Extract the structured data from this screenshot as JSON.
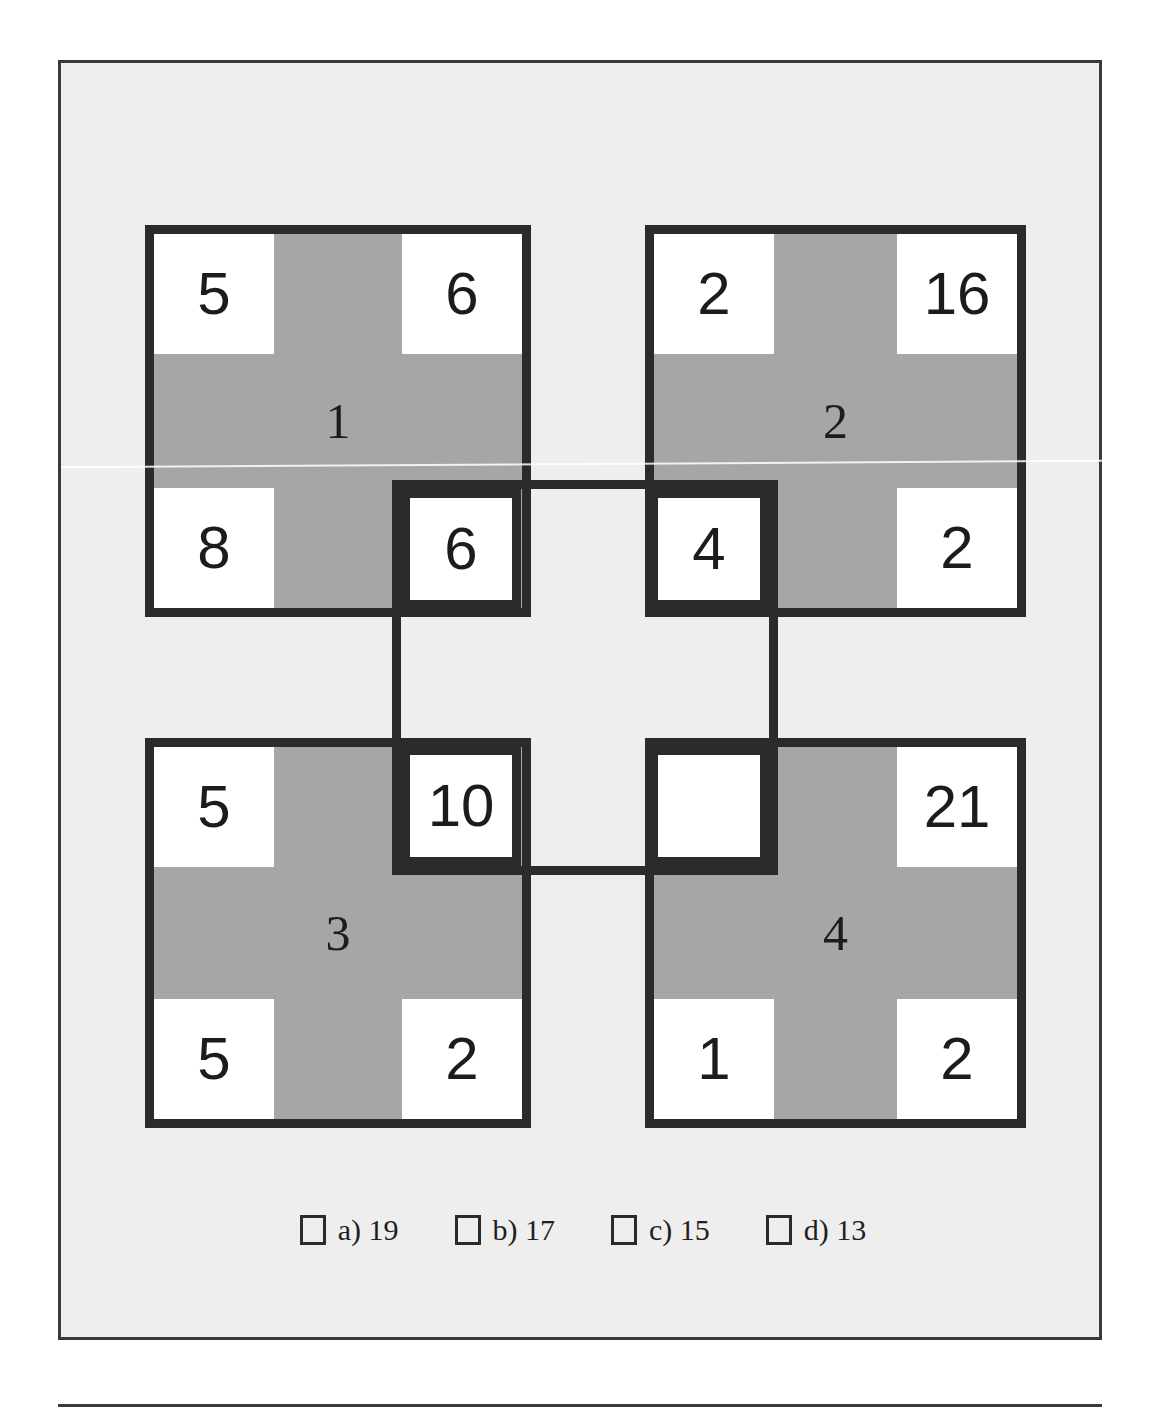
{
  "puzzle": {
    "kind": "number-square-logic-puzzle",
    "colors": {
      "page_background": "#ffffff",
      "panel_background": "#eeeeee",
      "square_fill": "#a6a6a6",
      "cell_fill": "#ffffff",
      "ink": "#1c1c1c",
      "border": "#2b2b2b"
    },
    "squares": [
      {
        "id": "square-1",
        "position": "top-left",
        "label": "1",
        "cells": {
          "top_left": "5",
          "top_right": "6",
          "bottom_left": "8",
          "bottom_right": "6"
        }
      },
      {
        "id": "square-2",
        "position": "top-right",
        "label": "2",
        "cells": {
          "top_left": "2",
          "top_right": "16",
          "bottom_left": "4",
          "bottom_right": "2"
        }
      },
      {
        "id": "square-3",
        "position": "bottom-left",
        "label": "3",
        "cells": {
          "top_left": "5",
          "top_right": "10",
          "bottom_left": "5",
          "bottom_right": "2"
        }
      },
      {
        "id": "square-4",
        "position": "bottom-right",
        "label": "4",
        "cells": {
          "top_left": "",
          "top_right": "21",
          "bottom_left": "1",
          "bottom_right": "2"
        }
      },
      {
        "id": "square-center",
        "position": "center-overlap",
        "label": "",
        "cells": {
          "top_left": "6",
          "top_right": "4",
          "bottom_left": "10",
          "bottom_right": ""
        }
      }
    ]
  },
  "answers": {
    "options": [
      {
        "id": "option-a",
        "label": "a) 19",
        "letter": "a",
        "value": "19"
      },
      {
        "id": "option-b",
        "label": "b) 17",
        "letter": "b",
        "value": "17"
      },
      {
        "id": "option-c",
        "label": "c) 15",
        "letter": "c",
        "value": "15"
      },
      {
        "id": "option-d",
        "label": "d) 13",
        "letter": "d",
        "value": "13"
      }
    ]
  }
}
